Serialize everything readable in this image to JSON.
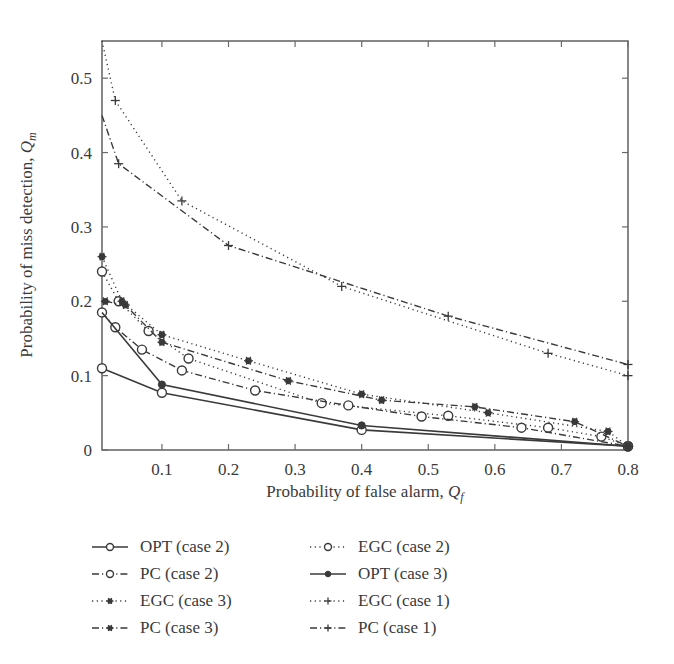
{
  "chart_data": {
    "type": "line",
    "title": "",
    "xlabel": "Probability of false alarm, Q_f",
    "ylabel": "Probability of miss detection, Q_m",
    "xlim": [
      0.01,
      0.8
    ],
    "ylim": [
      0,
      0.55
    ],
    "xticks": [
      0.1,
      0.2,
      0.3,
      0.4,
      0.5,
      0.6,
      0.7,
      0.8
    ],
    "xtick_labels": [
      "0.1",
      "0.2",
      "0.3",
      "0.4",
      "0.5",
      "0.6",
      "0.7",
      "0.8"
    ],
    "yticks": [
      0,
      0.1,
      0.2,
      0.3,
      0.4,
      0.5
    ],
    "ytick_labels": [
      "0",
      "0.1",
      "0.2",
      "0.3",
      "0.4",
      "0.5"
    ],
    "grid": false,
    "legend_position": "below plot, two columns",
    "series": [
      {
        "name": "OPT (case 2)",
        "style": "solid",
        "marker": "circle",
        "x": [
          0.01,
          0.1,
          0.4,
          0.8
        ],
        "y": [
          0.11,
          0.077,
          0.027,
          0.005
        ]
      },
      {
        "name": "EGC (case 2)",
        "style": "dotted",
        "marker": "circle",
        "x": [
          0.01,
          0.035,
          0.08,
          0.14,
          0.34,
          0.53,
          0.68,
          0.76,
          0.8
        ],
        "y": [
          0.24,
          0.2,
          0.16,
          0.123,
          0.063,
          0.046,
          0.03,
          0.018,
          0.005
        ]
      },
      {
        "name": "PC (case 2)",
        "style": "dashdot",
        "marker": "circle",
        "x": [
          0.01,
          0.03,
          0.07,
          0.13,
          0.24,
          0.38,
          0.49,
          0.64,
          0.8
        ],
        "y": [
          0.185,
          0.165,
          0.135,
          0.107,
          0.08,
          0.06,
          0.045,
          0.03,
          0.005
        ]
      },
      {
        "name": "OPT (case 3)",
        "style": "solid",
        "marker": "filled-circle",
        "x": [
          0.01,
          0.1,
          0.4,
          0.8
        ],
        "y": [
          0.185,
          0.088,
          0.033,
          0.005
        ]
      },
      {
        "name": "EGC (case 3)",
        "style": "dotted",
        "marker": "asterisk",
        "x": [
          0.01,
          0.04,
          0.1,
          0.23,
          0.4,
          0.59,
          0.77,
          0.8
        ],
        "y": [
          0.26,
          0.2,
          0.155,
          0.12,
          0.075,
          0.05,
          0.025,
          0.005
        ]
      },
      {
        "name": "EGC (case 1)",
        "style": "dotted",
        "marker": "plus",
        "x": [
          0.01,
          0.03,
          0.13,
          0.37,
          0.68,
          0.8
        ],
        "y": [
          0.55,
          0.47,
          0.335,
          0.22,
          0.13,
          0.1
        ]
      },
      {
        "name": "PC (case 3)",
        "style": "dashdot",
        "marker": "asterisk",
        "x": [
          0.015,
          0.045,
          0.1,
          0.29,
          0.43,
          0.57,
          0.72,
          0.8
        ],
        "y": [
          0.2,
          0.195,
          0.145,
          0.093,
          0.067,
          0.058,
          0.038,
          0.005
        ]
      },
      {
        "name": "PC (case 1)",
        "style": "dashdot",
        "marker": "plus",
        "x": [
          0.01,
          0.035,
          0.2,
          0.53,
          0.8
        ],
        "y": [
          0.45,
          0.385,
          0.275,
          0.18,
          0.115
        ]
      }
    ]
  },
  "legend": [
    {
      "label": "OPT (case 2)",
      "style": "solid",
      "marker": "circle"
    },
    {
      "label": "EGC (case 2)",
      "style": "dotted",
      "marker": "circle"
    },
    {
      "label": "PC (case 2)",
      "style": "dashdot",
      "marker": "circle"
    },
    {
      "label": "OPT (case 3)",
      "style": "solid",
      "marker": "filled-circle"
    },
    {
      "label": "EGC (case 3)",
      "style": "dotted",
      "marker": "asterisk"
    },
    {
      "label": "EGC (case 1)",
      "style": "dotted",
      "marker": "plus"
    },
    {
      "label": "PC (case 3)",
      "style": "dashdot",
      "marker": "asterisk"
    },
    {
      "label": "PC (case 1)",
      "style": "dashdot",
      "marker": "plus"
    }
  ],
  "axes": {
    "x_title_main": "Probability of false alarm, ",
    "x_title_sym": "Q",
    "x_title_sub": "f",
    "y_title_main": "Probability of miss detection, ",
    "y_title_sym": "Q",
    "y_title_sub": "m"
  },
  "colors": {
    "ink": "#3a3a3a",
    "axis": "#6a6a6a",
    "background": "#ffffff"
  }
}
